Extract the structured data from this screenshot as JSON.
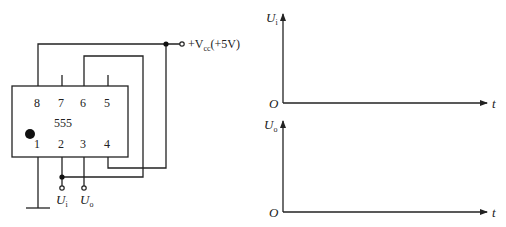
{
  "circuit": {
    "chip": {
      "label": "555",
      "top_pins": [
        "8",
        "7",
        "6",
        "5"
      ],
      "bottom_pins": [
        "1",
        "2",
        "3",
        "4"
      ]
    },
    "supply": {
      "prefix": "+V",
      "subscript": "cc",
      "suffix": "(+5V)"
    },
    "terminals": {
      "input": {
        "symbol": "U",
        "subscript": "i"
      },
      "output": {
        "symbol": "U",
        "subscript": "o"
      }
    }
  },
  "plots": [
    {
      "y_symbol": "U",
      "y_subscript": "i",
      "origin": "O",
      "x_label": "t"
    },
    {
      "y_symbol": "U",
      "y_subscript": "o",
      "origin": "O",
      "x_label": "t"
    }
  ]
}
